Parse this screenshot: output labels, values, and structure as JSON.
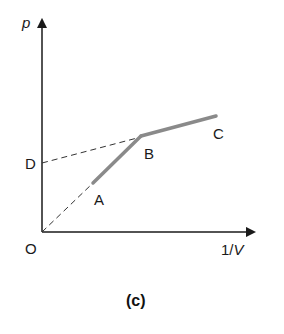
{
  "diagram": {
    "y_axis_label": "p",
    "x_axis_label_num": "1/",
    "x_axis_label_var": "V",
    "caption": "(c)",
    "points": {
      "O": "O",
      "A": "A",
      "B": "B",
      "C": "C",
      "D": "D"
    },
    "colors": {
      "axis": "#1a1a1a",
      "segment": "#8a8a8a",
      "dashed": "#333333"
    }
  }
}
